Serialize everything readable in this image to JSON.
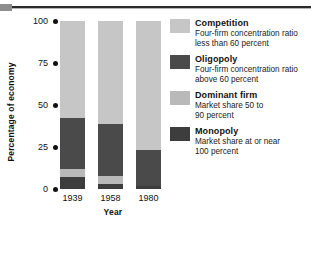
{
  "chart_data": {
    "type": "bar",
    "title": "",
    "subtitle": "",
    "stacked": true,
    "xlabel": "Year",
    "ylabel": "Percentage of economy",
    "categories": [
      "1939",
      "1958",
      "1980"
    ],
    "yticks": [
      "0",
      "25",
      "50",
      "75",
      "100"
    ],
    "ylim": [
      0,
      100
    ],
    "grid": false,
    "legend_position": "right",
    "series": [
      {
        "name": "Monopoly",
        "description_line1": "Market share at or near",
        "description_line2": "100 percent",
        "color": "#3d3d3d",
        "values": [
          7,
          3,
          2
        ]
      },
      {
        "name": "Dominant firm",
        "description_line1": "Market share 50 to",
        "description_line2": "90 percent",
        "color": "#b9b9b9",
        "values": [
          5,
          5,
          0
        ]
      },
      {
        "name": "Oligopoly",
        "description_line1": "Four-firm concentration ratio",
        "description_line2": "above 60 percent",
        "color": "#4a4a4a",
        "values": [
          30,
          31,
          21
        ]
      },
      {
        "name": "Competition",
        "description_line1": "Four-firm concentration ratio",
        "description_line2": "less than 60 percent",
        "color": "#c6c6c6",
        "values": [
          58,
          61,
          77
        ]
      }
    ]
  },
  "legend": {
    "items": [
      {
        "label": "Competition",
        "line1": "Four-firm concentration ratio",
        "line2": "less than 60 percent",
        "color": "#c6c6c6"
      },
      {
        "label": "Oligopoly",
        "line1": "Four-firm concentration ratio",
        "line2": "above 60 percent",
        "color": "#4a4a4a"
      },
      {
        "label": "Dominant firm",
        "line1": "Market share 50 to",
        "line2": "90 percent",
        "color": "#b9b9b9"
      },
      {
        "label": "Monopoly",
        "line1": "Market share at or near",
        "line2": "100 percent",
        "color": "#3d3d3d"
      }
    ]
  }
}
